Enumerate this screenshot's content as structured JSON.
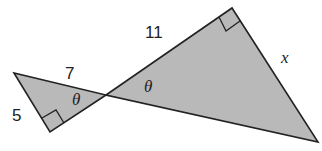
{
  "diagram": {
    "type": "similar-right-triangles",
    "fill_color": "#b9b9b9",
    "stroke_color": "#222222",
    "small_triangle": {
      "side_hypotenuse_label": "7",
      "side_leg_label": "5",
      "angle_label": "θ"
    },
    "large_triangle": {
      "side_hypotenuse_label": "11",
      "side_leg_label": "x",
      "angle_label": "θ"
    }
  }
}
